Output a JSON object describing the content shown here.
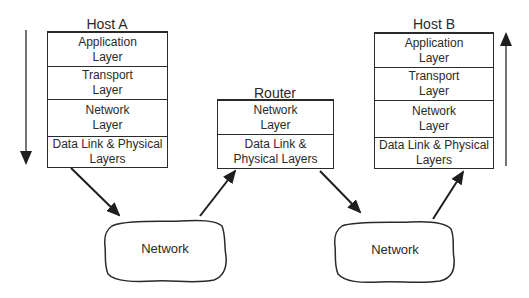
{
  "host_a": {
    "title": "Host A",
    "layers": [
      {
        "label": "Application\nLayer"
      },
      {
        "label": "Transport\nLayer"
      },
      {
        "label": "Network\nLayer"
      },
      {
        "label": "Data Link & Physical\nLayers"
      }
    ]
  },
  "router": {
    "title": "Router",
    "layers": [
      {
        "label": "Network\nLayer"
      },
      {
        "label": "Data Link &\nPhysical Layers"
      }
    ]
  },
  "host_b": {
    "title": "Host B",
    "layers": [
      {
        "label": "Application\nLayer"
      },
      {
        "label": "Transport\nLayer"
      },
      {
        "label": "Network\nLayer"
      },
      {
        "label": "Data Link & Physical\nLayers"
      }
    ]
  },
  "networks": [
    {
      "label": "Network"
    },
    {
      "label": "Network"
    }
  ],
  "colors": {
    "stroke": "#2a2a2a",
    "background": "#ffffff"
  }
}
